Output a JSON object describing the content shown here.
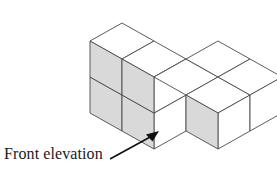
{
  "figure": {
    "name": "isometric-cube-solid",
    "projection": {
      "type": "isometric",
      "axis_right_up": [
        32,
        -18
      ],
      "axis_right_down": [
        32,
        18
      ],
      "axis_vertical": [
        0,
        36
      ],
      "origin": [
        90,
        113
      ]
    },
    "colors": {
      "top_face": "#ffffff",
      "left_face": "#ffffff",
      "right_face": "#d9d9d9",
      "edge_stroke": "#4a4a4a",
      "background": "#ffffff",
      "text": "#1a1a1a",
      "arrow": "#101010"
    },
    "cube_count": 8,
    "cubes": [
      {
        "id": "c1",
        "x": 0,
        "y": 0,
        "z": 0
      },
      {
        "id": "c2",
        "x": 1,
        "y": 0,
        "z": 0
      },
      {
        "id": "c3",
        "x": 0,
        "y": 0,
        "z": 1
      },
      {
        "id": "c4",
        "x": 1,
        "y": 0,
        "z": 1
      },
      {
        "id": "c5",
        "x": 1,
        "y": 1,
        "z": 0
      },
      {
        "id": "c6",
        "x": 2,
        "y": 1,
        "z": 0
      },
      {
        "id": "c7",
        "x": 1,
        "y": 2,
        "z": 0
      },
      {
        "id": "c8",
        "x": 2,
        "y": 2,
        "z": 0
      }
    ]
  },
  "caption": {
    "label": "Front elevation",
    "arrow": {
      "name": "front-elevation-arrow",
      "direction": "up-right",
      "angle_degrees": 40
    }
  }
}
